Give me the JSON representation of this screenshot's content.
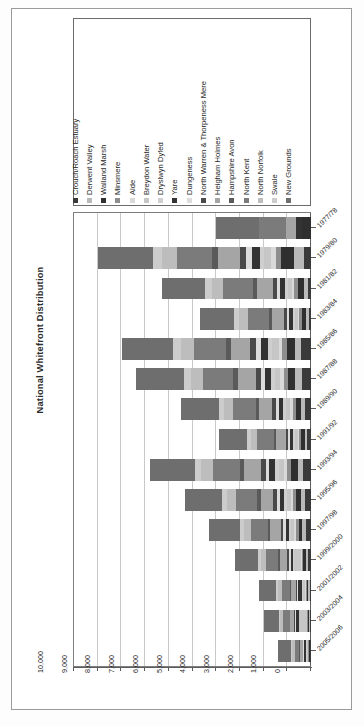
{
  "figure": {
    "title": "National Whitefront Distribution"
  },
  "legend": {
    "entries": [
      {
        "label": "Crouch/Roach Estuary",
        "color": "#3a3a3a"
      },
      {
        "label": "Derwent Valley",
        "color": "#b9b9b9"
      },
      {
        "label": "Walland Marsh",
        "color": "#2f2f2f"
      },
      {
        "label": "Minsmere",
        "color": "#8d8d8d"
      },
      {
        "label": "Alde",
        "color": "#d9d9d9"
      },
      {
        "label": "Breydon Water",
        "color": "#c6c6c6"
      },
      {
        "label": "Dryslwyn Dyfed",
        "color": "#cfcfcf"
      },
      {
        "label": "Yare",
        "color": "#333333"
      },
      {
        "label": "Dungeness",
        "color": "#dcdcdc"
      },
      {
        "label": "North Warren & Thorpeness Mere",
        "color": "#4a4a4a"
      },
      {
        "label": "Heigham Holmes",
        "color": "#a5a5a5"
      },
      {
        "label": "Hampshire Avon",
        "color": "#5a5a5a"
      },
      {
        "label": "North Kent",
        "color": "#7b7b7b"
      },
      {
        "label": "North Norfolk",
        "color": "#bdbdbd"
      },
      {
        "label": "Swale",
        "color": "#cccccc"
      },
      {
        "label": "New Grounds",
        "color": "#6e6e6e"
      }
    ]
  },
  "chart_data": {
    "type": "bar",
    "orientation": "horizontal-stacked",
    "title": "National Whitefront Distribution",
    "xlabel": "",
    "ylabel": "",
    "grid": true,
    "legend_position": "top",
    "value_axis": {
      "min": 0,
      "max": 10000,
      "step": 1000,
      "ticks": [
        10000,
        9000,
        8000,
        7000,
        6000,
        5000,
        4000,
        3000,
        2000,
        1000,
        0
      ],
      "tick_labels": [
        "10,000",
        "9,000",
        "8,000",
        "7,000",
        "6,000",
        "5,000",
        "4,000",
        "3,000",
        "2,000",
        "1,000",
        "0"
      ]
    },
    "categories": [
      "1977/78",
      "1979/80",
      "1981/82",
      "1983/84",
      "1985/86",
      "1987/88",
      "1989/90",
      "1991/92",
      "1993/94",
      "1995/96",
      "1997/98",
      "1999/2000",
      "2001/2002",
      "2003/2004",
      "2005/2006"
    ],
    "series": [
      {
        "name": "Crouch/Roach Estuary",
        "color": "#3a3a3a",
        "values": [
          0,
          310,
          120,
          90,
          420,
          380,
          260,
          150,
          330,
          250,
          210,
          120,
          60,
          40,
          30
        ]
      },
      {
        "name": "Derwent Valley",
        "color": "#b9b9b9",
        "values": [
          0,
          420,
          180,
          140,
          260,
          300,
          180,
          120,
          240,
          180,
          150,
          90,
          50,
          30,
          20
        ]
      },
      {
        "name": "Walland Marsh",
        "color": "#2f2f2f",
        "values": [
          380,
          520,
          260,
          160,
          330,
          280,
          210,
          140,
          260,
          200,
          160,
          110,
          70,
          50,
          40
        ]
      },
      {
        "name": "Minsmere",
        "color": "#8d8d8d",
        "values": [
          0,
          240,
          140,
          100,
          200,
          180,
          130,
          90,
          170,
          130,
          100,
          70,
          40,
          30,
          20
        ]
      },
      {
        "name": "Alde",
        "color": "#d9d9d9",
        "values": [
          0,
          180,
          110,
          80,
          160,
          150,
          110,
          70,
          140,
          100,
          80,
          50,
          30,
          20,
          20
        ]
      },
      {
        "name": "Breydon Water",
        "color": "#c6c6c6",
        "values": [
          0,
          300,
          160,
          120,
          280,
          240,
          170,
          110,
          220,
          160,
          130,
          260,
          90,
          330,
          60
        ]
      },
      {
        "name": "Dryslwyn Dyfed",
        "color": "#cfcfcf",
        "values": [
          0,
          200,
          120,
          90,
          180,
          160,
          120,
          80,
          150,
          110,
          90,
          60,
          40,
          30,
          20
        ]
      },
      {
        "name": "Yare",
        "color": "#333333",
        "values": [
          260,
          340,
          200,
          150,
          300,
          260,
          190,
          130,
          250,
          190,
          150,
          100,
          160,
          120,
          90
        ]
      },
      {
        "name": "Dungeness",
        "color": "#dcdcdc",
        "values": [
          0,
          220,
          130,
          100,
          190,
          170,
          120,
          80,
          160,
          120,
          100,
          60,
          40,
          30,
          20
        ]
      },
      {
        "name": "North Warren & Thorpeness Mere",
        "color": "#4a4a4a",
        "values": [
          0,
          280,
          170,
          120,
          240,
          210,
          150,
          100,
          200,
          150,
          120,
          80,
          50,
          40,
          30
        ]
      },
      {
        "name": "Heigham Holmes",
        "color": "#a5a5a5",
        "values": [
          420,
          900,
          700,
          520,
          820,
          760,
          560,
          400,
          700,
          540,
          430,
          300,
          200,
          150,
          110
        ]
      },
      {
        "name": "Hampshire Avon",
        "color": "#5a5a5a",
        "values": [
          0,
          260,
          160,
          110,
          220,
          200,
          140,
          100,
          190,
          140,
          110,
          80,
          50,
          40,
          30
        ]
      },
      {
        "name": "North Kent",
        "color": "#7b7b7b",
        "values": [
          1150,
          1500,
          1250,
          900,
          1350,
          1250,
          950,
          700,
          1150,
          900,
          720,
          520,
          360,
          280,
          210
        ]
      },
      {
        "name": "North Norfolk",
        "color": "#bdbdbd",
        "values": [
          0,
          640,
          480,
          360,
          560,
          520,
          380,
          280,
          480,
          370,
          300,
          210,
          150,
          110,
          90
        ]
      },
      {
        "name": "Swale",
        "color": "#cccccc",
        "values": [
          0,
          380,
          280,
          210,
          330,
          300,
          220,
          160,
          280,
          220,
          170,
          120,
          90,
          70,
          50
        ]
      },
      {
        "name": "New Grounds",
        "color": "#6e6e6e",
        "values": [
          1790,
          2310,
          1840,
          1450,
          2160,
          2040,
          1610,
          1190,
          1880,
          1540,
          1280,
          970,
          720,
          630,
          560
        ]
      }
    ],
    "totals": [
      4000,
      9000,
      6100,
      4600,
      8000,
      7400,
      5500,
      3900,
      6800,
      5300,
      4300,
      3200,
      2200,
      2000,
      1400
    ]
  }
}
